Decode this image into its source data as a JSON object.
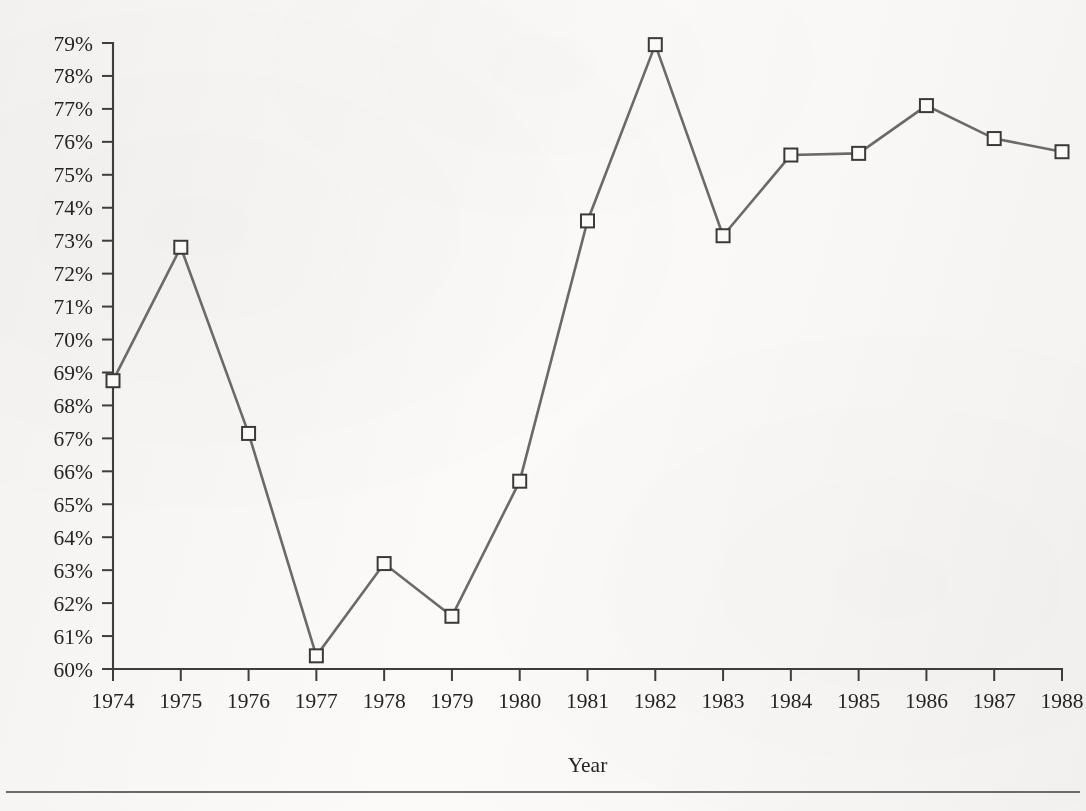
{
  "chart_data": {
    "type": "line",
    "title": "",
    "subtitle": "",
    "xlabel": "Year",
    "ylabel": "",
    "categories": [
      1974,
      1975,
      1976,
      1977,
      1978,
      1979,
      1980,
      1981,
      1982,
      1983,
      1984,
      1985,
      1986,
      1987,
      1988
    ],
    "values": [
      68.75,
      72.8,
      67.15,
      60.4,
      63.2,
      61.6,
      65.7,
      73.6,
      78.95,
      73.15,
      75.6,
      75.65,
      77.1,
      76.1,
      75.7
    ],
    "series": [
      {
        "name": "",
        "values": [
          68.75,
          72.8,
          67.15,
          60.4,
          63.2,
          61.6,
          65.7,
          73.6,
          78.95,
          73.15,
          75.6,
          75.65,
          77.1,
          76.1,
          75.7
        ]
      }
    ],
    "ylim": [
      60,
      79
    ],
    "xlim": [
      1974,
      1988
    ],
    "y_tick_labels": [
      "60%",
      "61%",
      "62%",
      "63%",
      "64%",
      "65%",
      "66%",
      "67%",
      "68%",
      "69%",
      "70%",
      "71%",
      "72%",
      "73%",
      "74%",
      "75%",
      "76%",
      "77%",
      "78%",
      "79%"
    ],
    "y_tick_values": [
      60,
      61,
      62,
      63,
      64,
      65,
      66,
      67,
      68,
      69,
      70,
      71,
      72,
      73,
      74,
      75,
      76,
      77,
      78,
      79
    ],
    "x_tick_labels": [
      "1974",
      "1975",
      "1976",
      "1977",
      "1978",
      "1979",
      "1980",
      "1981",
      "1982",
      "1983",
      "1984",
      "1985",
      "1986",
      "1987",
      "1988"
    ],
    "grid": false,
    "legend": "none",
    "marker": "open-square",
    "line_color": "#6a6a6a",
    "marker_fill": "#fbfaf8",
    "marker_edge_color": "#3a3a3a",
    "axis_color": "#3d3d3d",
    "background_color": "#f7f6f4"
  },
  "figure": {
    "axis_title_x": "Year",
    "footer_rule": true
  }
}
